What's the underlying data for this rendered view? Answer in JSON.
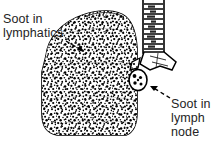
{
  "figure": {
    "background_color": "#ffffff",
    "ink_color": "#000000",
    "text_color": "#242424",
    "width": 213,
    "height": 148
  },
  "labels": {
    "lymphatics": "Soot in\nlymphatics",
    "lymph_node": "Soot in\nlymph\nnode"
  },
  "anatomy": {
    "lung": {
      "name": "lung",
      "fill": "#ffffff",
      "stipple_color": "#000000",
      "stipple_description": "dense black stippling representing soot"
    },
    "trachea": {
      "name": "trachea",
      "ring_count": 10,
      "fill": "#ffffff"
    },
    "bronchus": {
      "name": "bronchus",
      "fill": "#ffffff"
    },
    "lymph_node": {
      "name": "lymph-node",
      "fill": "#ffffff",
      "spot_count": 5,
      "spot_color": "#000000"
    }
  },
  "leader_lines": {
    "lymphatics": {
      "style": "dashed",
      "arrow": "arrowhead pointing down-right to lung border"
    },
    "lymph_node": {
      "style": "dashed",
      "arrow": "arrowhead pointing up-left to lymph node"
    }
  }
}
